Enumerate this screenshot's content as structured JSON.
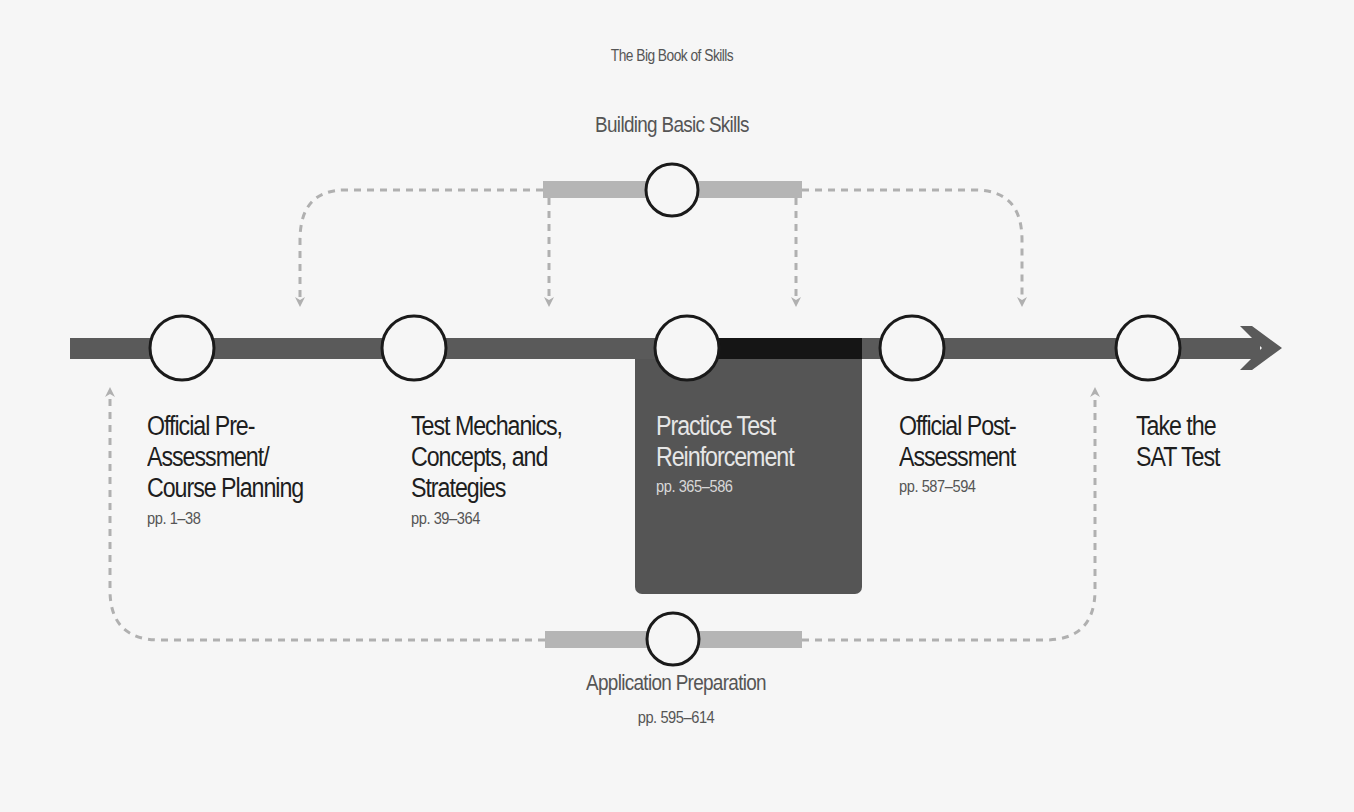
{
  "colors": {
    "background": "#f6f6f6",
    "timeline": "#5a5a5a",
    "timeline_highlight": "#111111",
    "highlight_box": "#555555",
    "branch_bar": "#b5b5b5",
    "dashed": "#b0b0b0",
    "node_stroke": "#1a1a1a"
  },
  "top_branch": {
    "subtitle": "The Big Book of Skills",
    "title": "Building Basic Skills"
  },
  "bottom_branch": {
    "title": "Application Preparation",
    "pages": "pp. 595–614"
  },
  "steps": [
    {
      "title": "Official Pre-\nAssessment/\nCourse Planning",
      "pages": "pp. 1–38",
      "highlighted": false
    },
    {
      "title": "Test Mechanics,\nConcepts, and\nStrategies",
      "pages": "pp. 39–364",
      "highlighted": false
    },
    {
      "title": "Practice Test\nReinforcement",
      "pages": "pp. 365–586",
      "highlighted": true
    },
    {
      "title": "Official Post-\nAssessment",
      "pages": "pp. 587–594",
      "highlighted": false
    },
    {
      "title": "Take the\nSAT Test",
      "pages": "",
      "highlighted": false
    }
  ],
  "icons": {
    "timeline_end": "arrow-right-icon",
    "node": "circle-node-icon",
    "connector_arrow": "arrowhead-icon"
  }
}
